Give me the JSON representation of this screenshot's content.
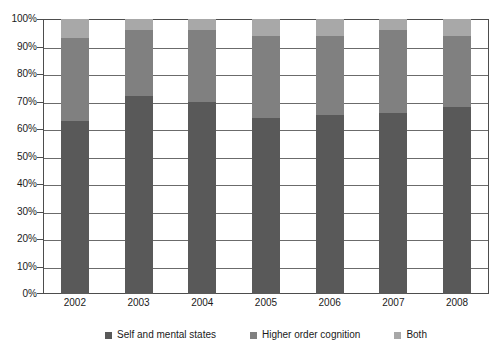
{
  "chart_data": {
    "type": "bar",
    "subtype": "stacked-bar-100-percent",
    "title": "",
    "subtitle": "",
    "xlabel": "",
    "ylabel": "",
    "categories": [
      "2002",
      "2003",
      "2004",
      "2005",
      "2006",
      "2007",
      "2008"
    ],
    "series": [
      {
        "name": "Self and mental states",
        "color": "#595959",
        "values": [
          63,
          72,
          70,
          64,
          65,
          66,
          68
        ]
      },
      {
        "name": "Higher order cognition",
        "color": "#808080",
        "values": [
          30,
          24,
          26,
          30,
          29,
          30,
          26
        ]
      },
      {
        "name": "Both",
        "color": "#a8a8a8",
        "values": [
          7,
          4,
          4,
          6,
          6,
          4,
          6
        ]
      }
    ],
    "ylim": [
      0,
      100
    ],
    "y_tick_labels": [
      "100%",
      "90%",
      "80%",
      "70%",
      "60%",
      "50%",
      "40%",
      "30%",
      "20%",
      "10%",
      "0%"
    ],
    "y_tick_values": [
      100,
      90,
      80,
      70,
      60,
      50,
      40,
      30,
      20,
      10,
      0
    ],
    "grid": true,
    "grid_axis": "y",
    "legend_position": "bottom",
    "stack_order_bottom_to_top": [
      "Self and mental states",
      "Higher order cognition",
      "Both"
    ],
    "plot_background": "#ffffff",
    "gridline_color": "#6b6b6b",
    "axis_color": "#4d4d4d"
  },
  "legend": {
    "items": [
      {
        "label": "Self and mental states",
        "color": "#595959"
      },
      {
        "label": "Higher order cognition",
        "color": "#808080"
      },
      {
        "label": "Both",
        "color": "#a8a8a8"
      }
    ]
  }
}
